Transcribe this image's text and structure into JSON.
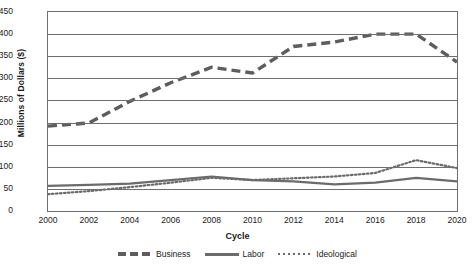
{
  "chart_data": {
    "type": "line",
    "title": "",
    "xlabel": "Cycle",
    "ylabel": "Millions of Dollars ($)",
    "x": [
      2000,
      2002,
      2004,
      2006,
      2008,
      2010,
      2012,
      2014,
      2016,
      2018,
      2020
    ],
    "xticklabels": [
      "2000",
      "2002",
      "2004",
      "2006",
      "2008",
      "2010",
      "2012",
      "2014",
      "2016",
      "2018",
      "2020"
    ],
    "yticklabels": [
      "0",
      "50",
      "100",
      "150",
      "200",
      "250",
      "300",
      "350",
      "400",
      "450"
    ],
    "yticks": [
      0,
      50,
      100,
      150,
      200,
      250,
      300,
      350,
      400,
      450
    ],
    "xlim": [
      2000,
      2020
    ],
    "ylim": [
      0,
      450
    ],
    "grid": "horizontal",
    "legend_position": "bottom",
    "series": [
      {
        "name": "Business",
        "style": "dashed",
        "color": "#5d5d5d",
        "values": [
          192,
          199,
          248,
          290,
          325,
          312,
          372,
          382,
          400,
          400,
          337
        ]
      },
      {
        "name": "Labor",
        "style": "solid",
        "color": "#6b6b6b",
        "values": [
          57,
          59,
          62,
          70,
          78,
          70,
          67,
          60,
          64,
          75,
          67
        ]
      },
      {
        "name": "Ideological",
        "style": "dotted",
        "color": "#6b6b6b",
        "values": [
          38,
          45,
          54,
          64,
          75,
          70,
          74,
          78,
          86,
          115,
          97
        ]
      }
    ]
  }
}
